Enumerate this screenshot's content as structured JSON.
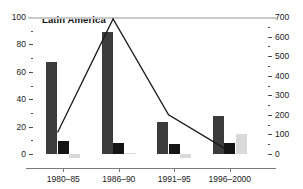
{
  "chart_data": {
    "type": "bar",
    "title": "Latin America",
    "xlabel": "",
    "ylabel": "",
    "grid": false,
    "legend": "none",
    "categories": [
      "1980–85",
      "1986–90",
      "1991–95",
      "1996–2000"
    ],
    "left_axis": {
      "ylim": [
        0,
        100
      ],
      "ticks": [
        0,
        20,
        40,
        60,
        80,
        100
      ],
      "minor_ticks": [
        10,
        30,
        50,
        70,
        90
      ],
      "tick_labels": [
        "0",
        "20",
        "40",
        "60",
        "80",
        "100"
      ]
    },
    "right_axis": {
      "ylim": [
        0,
        700
      ],
      "ticks": [
        0,
        100,
        200,
        300,
        400,
        500,
        600,
        700
      ],
      "minor_ticks": [
        50,
        150,
        250,
        350,
        450,
        550,
        650
      ],
      "tick_labels": [
        "0",
        "100",
        "200",
        "300",
        "400",
        "500",
        "600",
        "700"
      ]
    },
    "series": [
      {
        "name": "series-1-dark",
        "axis": "left",
        "type": "bar",
        "color": "#3b3b3b",
        "values": [
          67,
          89,
          23,
          28
        ]
      },
      {
        "name": "series-2-black",
        "axis": "left",
        "type": "bar",
        "color": "#141414",
        "values": [
          9.5,
          8,
          7,
          8
        ]
      },
      {
        "name": "series-3-light",
        "axis": "left",
        "type": "bar",
        "color": "#d9d9d9",
        "values": [
          -3,
          1,
          -3,
          14.5
        ]
      },
      {
        "name": "series-4-line",
        "axis": "right",
        "type": "line",
        "color": "#1a1a1a",
        "values": [
          110,
          690,
          200,
          30
        ]
      }
    ]
  },
  "colors": {
    "bar_dark": "#3b3b3b",
    "bar_black": "#141414",
    "bar_light": "#d9d9d9",
    "line": "#1a1a1a",
    "axis": "#7a7a7a",
    "zero_line": "#c9c9c9",
    "text": "#1a1a1a",
    "background": "#ffffff"
  }
}
